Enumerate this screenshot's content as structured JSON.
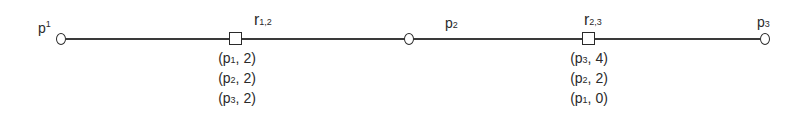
{
  "diagram": {
    "nodes": [
      {
        "id": "p1",
        "type": "circle",
        "label_base": "p",
        "label_index": "1"
      },
      {
        "id": "r12",
        "type": "square",
        "label_base": "r",
        "label_index": "1,2"
      },
      {
        "id": "p2",
        "type": "circle",
        "label_base": "p",
        "label_index": "2"
      },
      {
        "id": "r23",
        "type": "square",
        "label_base": "r",
        "label_index": "2,3"
      },
      {
        "id": "p3",
        "type": "circle",
        "label_base": "p",
        "label_index": "3"
      }
    ],
    "tables": {
      "r12": [
        {
          "open": "(p",
          "idx": "1",
          "rest": ", 2)"
        },
        {
          "open": "(p",
          "idx": "2",
          "rest": ", 2)"
        },
        {
          "open": "(p",
          "idx": "3",
          "rest": ", 2)"
        }
      ],
      "r23": [
        {
          "open": "(p",
          "idx": "3",
          "rest": ", 4)"
        },
        {
          "open": "(p",
          "idx": "2",
          "rest": ", 2)"
        },
        {
          "open": "(p",
          "idx": "1",
          "rest": ", 0)"
        }
      ]
    }
  }
}
